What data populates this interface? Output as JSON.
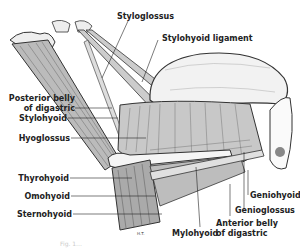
{
  "figure": {
    "labels": {
      "styloglossus": "Styloglossus",
      "stylohyoid_ligament": "Stylohyoid ligament",
      "posterior_belly_l1": "Posterior belly",
      "posterior_belly_l2": "of digastric",
      "stylohyoid": "Stylohyoid",
      "hyoglossus": "Hyoglossus",
      "thyrohyoid": "Thyrohyoid",
      "omohyoid": "Omohyoid",
      "sternohyoid": "Sternohyoid",
      "geniohyoid": "Geniohyoid",
      "genioglossus": "Genioglossus",
      "anterior_belly_l1": "Anterior belly",
      "anterior_belly_l2": "of digastric",
      "mylohyoid": "Mylohyoid"
    },
    "artist_initials": "H.T.",
    "caption": "Fig. 1…"
  },
  "colors": {
    "ink": "#222222",
    "background": "#ffffff",
    "muscle_fill": "#cfcfcf",
    "tongue_fill": "#f2f2f2"
  }
}
